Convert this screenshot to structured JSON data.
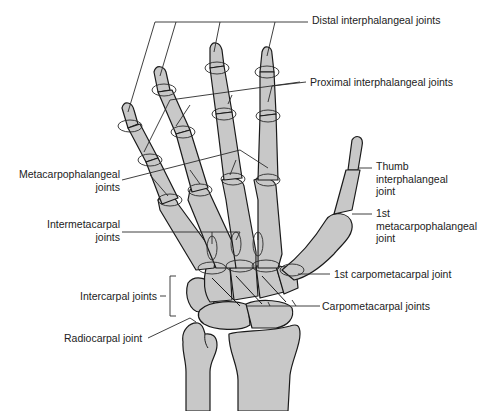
{
  "figure": {
    "colors": {
      "bone_fill": "#c8c8c8",
      "outline": "#1a1a1a",
      "background": "#ffffff",
      "text": "#222222"
    }
  },
  "labels": {
    "distal_ip": "Distal interphalangeal joints",
    "proximal_ip": "Proximal interphalangeal joints",
    "mcp": "Metacarpophalangeal\njoints",
    "intermetacarpal": "Intermetacarpal\njoints",
    "thumb_ip": "Thumb\ninterphalangeal\njoint",
    "first_mcp": "1st\nmetacarpophalangeal\njoint",
    "first_cmc": "1st carpometacarpal joint",
    "intercarpal": "Intercarpal joints",
    "cmc": "Carpometacarpal joints",
    "radiocarpal": "Radiocarpal joint"
  }
}
